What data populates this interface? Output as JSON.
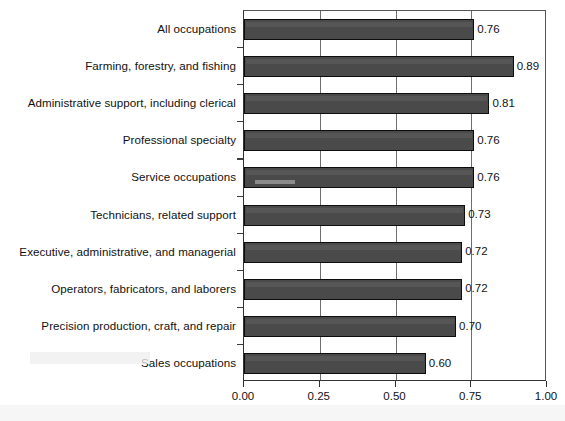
{
  "chart_data": {
    "type": "bar",
    "orientation": "horizontal",
    "title": "",
    "xlabel": "",
    "ylabel": "",
    "xlim": [
      0.0,
      1.0
    ],
    "xticks": [
      "0.00",
      "0.25",
      "0.50",
      "0.75",
      "1.00"
    ],
    "xtick_values": [
      0.0,
      0.25,
      0.5,
      0.75,
      1.0
    ],
    "grid": "vertical",
    "legend": "none",
    "bar_color": "#4a4a4a",
    "bar_edge_color": "#0d0d0d",
    "categories": [
      "All occupations",
      "Farming, forestry, and fishing",
      "Administrative support, including clerical",
      "Professional specialty",
      "Service occupations",
      "Technicians, related support",
      "Executive, administrative, and managerial",
      "Operators, fabricators, and laborers",
      "Precision production, craft, and repair",
      "Sales occupations"
    ],
    "values": [
      0.76,
      0.89,
      0.81,
      0.76,
      0.76,
      0.73,
      0.72,
      0.72,
      0.7,
      0.6
    ],
    "value_labels": [
      "0.76",
      "0.89",
      "0.81",
      "0.76",
      "0.76",
      "0.73",
      "0.72",
      "0.72",
      "0.70",
      "0.60"
    ]
  },
  "artifacts": {
    "title_remnant": ""
  }
}
